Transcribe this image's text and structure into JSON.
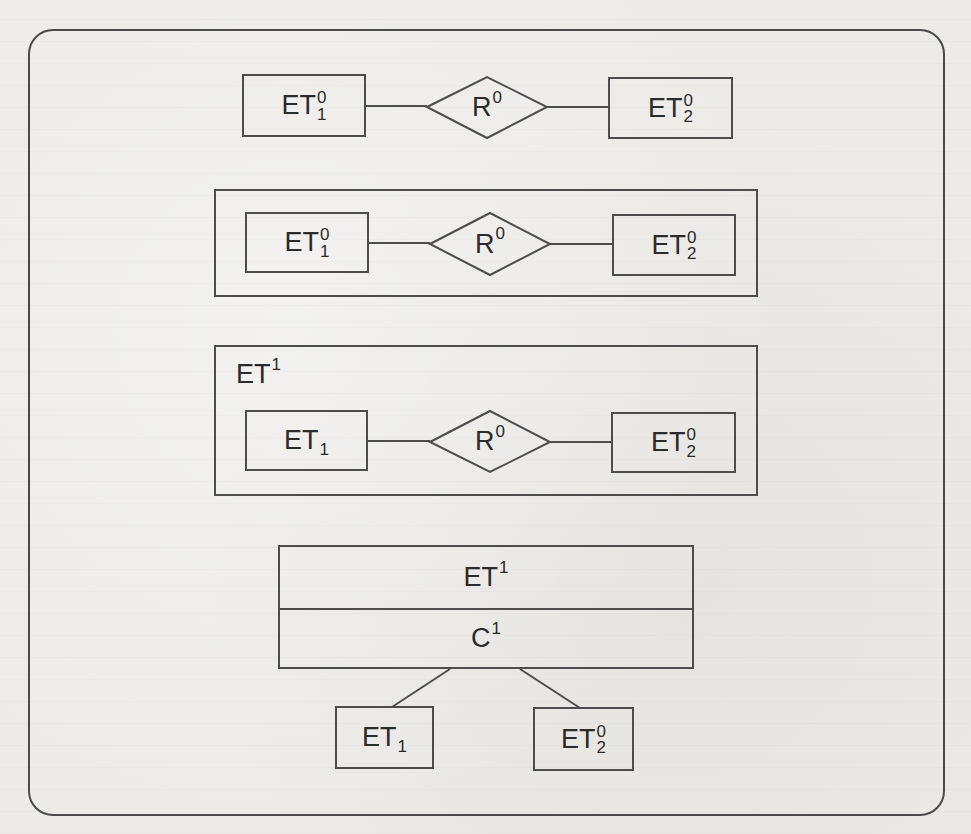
{
  "diagram": {
    "type": "ER-abstraction-levels",
    "colors": {
      "background": "#ecebe8",
      "stroke": "#4d4d4d",
      "text": "#2b2b2b"
    },
    "row1": {
      "left_entity": {
        "base": "ET",
        "sup": "0",
        "sub": "1"
      },
      "relationship": {
        "base": "R",
        "sup": "0"
      },
      "right_entity": {
        "base": "ET",
        "sup": "0",
        "sub": "2"
      }
    },
    "row2": {
      "left_entity": {
        "base": "ET",
        "sup": "0",
        "sub": "1"
      },
      "relationship": {
        "base": "R",
        "sup": "0"
      },
      "right_entity": {
        "base": "ET",
        "sup": "0",
        "sub": "2"
      }
    },
    "row3": {
      "container_label": {
        "base": "ET",
        "sup": "1"
      },
      "left_entity": {
        "base": "ET",
        "sub": "1"
      },
      "relationship": {
        "base": "R",
        "sup": "0"
      },
      "right_entity": {
        "base": "ET",
        "sup": "0",
        "sub": "2"
      }
    },
    "row4": {
      "top_label": {
        "base": "ET",
        "sup": "1"
      },
      "bottom_label": {
        "base": "C",
        "sup": "1"
      },
      "left_child": {
        "base": "ET",
        "sub": "1"
      },
      "right_child": {
        "base": "ET",
        "sup": "0",
        "sub": "2"
      }
    }
  }
}
